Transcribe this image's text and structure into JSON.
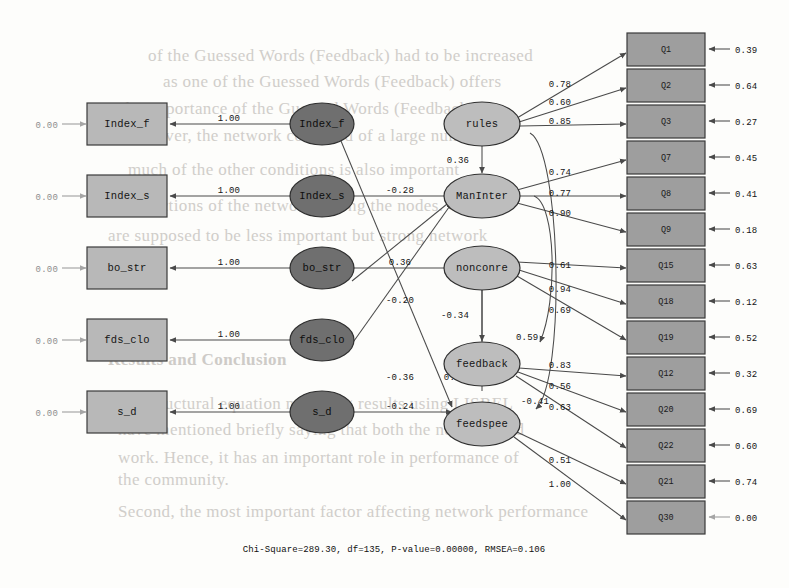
{
  "figure": {
    "kind": "sem-path-diagram",
    "caption": "Chi-Square=289.30, df=135, P-value=0.00000, RMSEA=0.106",
    "colors": {
      "observed_box_fill": "#b8b8b8",
      "indicator_box_fill": "#9e9e9e",
      "exogenous_latent_fill": "#6f6f6f",
      "endogenous_latent_fill": "#bdbdbd",
      "outline": "#2f2f2f",
      "path": "#4a4a4a"
    }
  },
  "left_observed_boxes": [
    {
      "label": "Index_f",
      "residual": "0.00",
      "loading": "1.00"
    },
    {
      "label": "Index_s",
      "residual": "0.00",
      "loading": "1.00"
    },
    {
      "label": "bo_str",
      "residual": "0.00",
      "loading": "1.00"
    },
    {
      "label": "fds_clo",
      "residual": "0.00",
      "loading": "1.00"
    },
    {
      "label": "s_d",
      "residual": "0.00",
      "loading": "1.00"
    }
  ],
  "exogenous_latents": [
    {
      "label": "Index_f"
    },
    {
      "label": "Index_s"
    },
    {
      "label": "bo_str"
    },
    {
      "label": "fds_clo"
    },
    {
      "label": "s_d"
    }
  ],
  "endogenous_latents": [
    {
      "label": "rules"
    },
    {
      "label": "ManInter"
    },
    {
      "label": "nonconre"
    },
    {
      "label": "feedback"
    },
    {
      "label": "feedspee"
    }
  ],
  "indicator_boxes": [
    {
      "label": "Q1",
      "residual": "0.39",
      "loading": "0.78",
      "from": "rules"
    },
    {
      "label": "Q2",
      "residual": "0.64",
      "loading": "0.60",
      "from": "rules"
    },
    {
      "label": "Q3",
      "residual": "0.27",
      "loading": "0.85",
      "from": "rules"
    },
    {
      "label": "Q7",
      "residual": "0.45",
      "loading": "0.74",
      "from": "ManInter"
    },
    {
      "label": "Q8",
      "residual": "0.41",
      "loading": "0.77",
      "from": "ManInter"
    },
    {
      "label": "Q9",
      "residual": "0.18",
      "loading": "0.90",
      "from": "ManInter"
    },
    {
      "label": "Q15",
      "residual": "0.63",
      "loading": "0.61",
      "from": "nonconre"
    },
    {
      "label": "Q18",
      "residual": "0.12",
      "loading": "0.94",
      "from": "nonconre"
    },
    {
      "label": "Q19",
      "residual": "0.52",
      "loading": "0.69",
      "from": "nonconre"
    },
    {
      "label": "Q12",
      "residual": "0.32",
      "loading": "0.83",
      "from": "feedback"
    },
    {
      "label": "Q20",
      "residual": "0.69",
      "loading": "0.56",
      "from": "feedback"
    },
    {
      "label": "Q22",
      "residual": "0.60",
      "loading": "0.63",
      "from": "feedback"
    },
    {
      "label": "Q21",
      "residual": "0.74",
      "loading": "0.51",
      "from": "feedspee"
    },
    {
      "label": "Q30",
      "residual": "0.00",
      "loading": "1.00",
      "from": "feedspee"
    }
  ],
  "structural_paths": [
    {
      "from": "Index_s",
      "to": "ManInter",
      "coef": "-0.28"
    },
    {
      "from": "bo_str",
      "to": "nonconre",
      "coef": "0.36"
    },
    {
      "from": "Index_f",
      "to": "feedspee",
      "coef": "-0.20"
    },
    {
      "from": "fds_clo",
      "to": "ManInter",
      "coef": "-0.36"
    },
    {
      "from": "s_d",
      "to": "feedspee",
      "coef": "-0.24"
    },
    {
      "from": "bo_str",
      "to": "ManInter",
      "coef": "0.26"
    },
    {
      "from": "rules",
      "to": "ManInter",
      "coef": "0.36"
    },
    {
      "from": "nonconre",
      "to": "feedback",
      "coef": "-0.34"
    },
    {
      "from": "rules",
      "to": "feedspee",
      "coef": "-0.41"
    },
    {
      "from": "ManInter",
      "to": "feedback",
      "coef": "0.59"
    }
  ],
  "coef_labels": {
    "l_minus_028": "-0.28",
    "l_036_bo": "0.36",
    "l_minus_020": "-0.20",
    "l_minus_036": "-0.36",
    "l_minus_024": "-0.24",
    "l_026": "0.26",
    "l_036_rules": "0.36",
    "l_minus_034": "-0.34",
    "l_059": "0.59",
    "l_minus_041": "-0.41",
    "ld_078": "0.78",
    "ld_060": "0.60",
    "ld_085": "0.85",
    "ld_074": "0.74",
    "ld_077": "0.77",
    "ld_090": "0.90",
    "ld_061": "0.61",
    "ld_094": "0.94",
    "ld_069": "0.69",
    "ld_083": "0.83",
    "ld_056": "0.56",
    "ld_063": "0.63",
    "ld_051": "0.51",
    "ld_100": "1.00",
    "one_00": "1.00",
    "zero_00": "0.00",
    "r_039": "0.39",
    "r_064": "0.64",
    "r_027": "0.27",
    "r_045": "0.45",
    "r_041": "0.41",
    "r_018": "0.18",
    "r_063": "0.63",
    "r_012": "0.12",
    "r_052": "0.52",
    "r_032": "0.32",
    "r_069": "0.69",
    "r_060": "0.60",
    "r_074": "0.74",
    "r_000": "0.00"
  },
  "background_bleed": [
    {
      "text": "of the Guessed Words (Feedback) had to be increased",
      "x": 148,
      "y": 46
    },
    {
      "text": "as one of the Guessed Words (Feedback) offers",
      "x": 163,
      "y": 72
    },
    {
      "text": "so the importance of the Guessed Words (Feedback)",
      "x": 100,
      "y": 99
    },
    {
      "text": "Moreover, the network consisted of a large number of",
      "x": 118,
      "y": 126
    },
    {
      "text": "much of the other conditions is also important",
      "x": 128,
      "y": 160
    },
    {
      "text": "connections of the network among the nodes. Only",
      "x": 118,
      "y": 196
    },
    {
      "text": "are supposed to be less important but strong network",
      "x": 108,
      "y": 226
    },
    {
      "text": "etc.",
      "x": 118,
      "y": 256
    },
    {
      "text": "Results and Conclusion",
      "x": 108,
      "y": 350,
      "cls": "hdr"
    },
    {
      "text": "the structural equation modeling results using LISREL",
      "x": 120,
      "y": 394
    },
    {
      "text": "have mentioned briefly saying that both the network and",
      "x": 118,
      "y": 420
    },
    {
      "text": "work. Hence, it has an important role in performance of",
      "x": 118,
      "y": 448
    },
    {
      "text": "the community.",
      "x": 118,
      "y": 470
    },
    {
      "text": "Second, the most important factor affecting network performance",
      "x": 118,
      "y": 502
    }
  ]
}
